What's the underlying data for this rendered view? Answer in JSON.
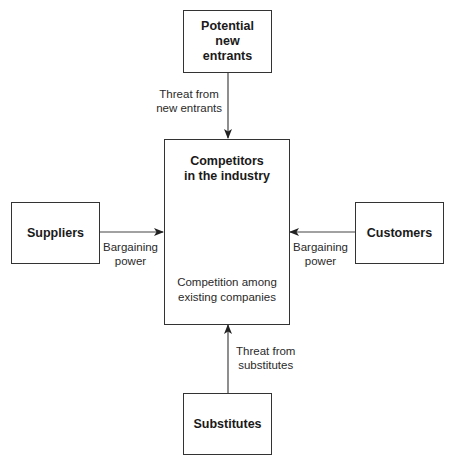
{
  "diagram": {
    "nodes": {
      "top": {
        "label": "Potential\nnew\nentrants"
      },
      "center": {
        "label": "Competitors\nin the industry",
        "sublabel": "Competition among\nexisting companies"
      },
      "left": {
        "label": "Suppliers"
      },
      "right": {
        "label": "Customers"
      },
      "bottom": {
        "label": "Substitutes"
      }
    },
    "edges": {
      "top_to_center": {
        "label": "Threat from\nnew entrants"
      },
      "left_to_center": {
        "label": "Bargaining\npower"
      },
      "right_to_center": {
        "label": "Bargaining\npower"
      },
      "bottom_to_center": {
        "label": "Threat from\nsubstitutes"
      }
    },
    "colors": {
      "stroke": "#333333",
      "text": "#1a1a1a",
      "background": "#ffffff"
    }
  }
}
